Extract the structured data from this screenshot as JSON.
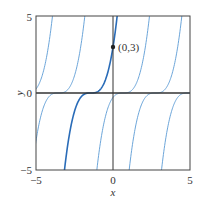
{
  "chart_data": {
    "type": "line",
    "title": "",
    "xlabel": "x",
    "ylabel": "y",
    "xlim": [
      -5,
      5
    ],
    "ylim": [
      -5,
      5
    ],
    "x_ticks": [
      "-5",
      "0",
      "5"
    ],
    "y_ticks": [
      "-5",
      "0",
      "5"
    ],
    "grid": false,
    "family": "y = (x - c)^3",
    "series": [
      {
        "name": "c=-5.64",
        "c": -5.64,
        "highlight": false
      },
      {
        "name": "c=-3.54",
        "c": -3.54,
        "highlight": false
      },
      {
        "name": "c=-1.44 (through (0,3))",
        "c": -1.44,
        "highlight": true
      },
      {
        "name": "c=0.66",
        "c": 0.66,
        "highlight": false
      },
      {
        "name": "c=2.76",
        "c": 2.76,
        "highlight": false
      },
      {
        "name": "c=4.86",
        "c": 4.86,
        "highlight": false
      }
    ],
    "equilibrium": {
      "name": "y=0",
      "value": 0
    },
    "annotations": [
      {
        "text": "(0,3)",
        "x": 0,
        "y": 3
      }
    ],
    "colors": {
      "curve": "#5b9bd5",
      "highlight": "#2a6cb8",
      "axis": "#333333"
    }
  },
  "labels": {
    "x_min": "−5",
    "x_zero": "0",
    "x_max": "5",
    "y_min": "−5",
    "y_zero": "0",
    "y_max": "5",
    "x_axis": "x",
    "y_axis": "y",
    "point": "(0,3)"
  }
}
